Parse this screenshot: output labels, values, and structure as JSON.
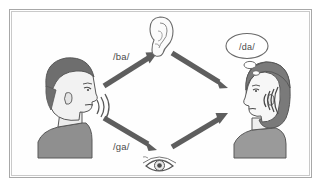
{
  "figure": {
    "name": "mcgurk-effect-diagram",
    "background_color": "#fefefe",
    "frame": {
      "outer_color": "#b5b5b5",
      "inner_color": "#d8d8d8"
    }
  },
  "speaker": {
    "name": "male-speaker",
    "facing": "right",
    "hair_color": "#6e6e6e",
    "skin_color": "#f2f2f2",
    "shirt_color": "#8f8f8f",
    "outline_color": "#555555",
    "sound_waves_count": 3
  },
  "listener": {
    "name": "female-listener",
    "facing": "left",
    "hair_color": "#7a7a7a",
    "skin_color": "#f7f7f7",
    "shirt_color": "#9a9a9a",
    "outline_color": "#555555",
    "sound_waves_count": 4
  },
  "icons": {
    "ear": {
      "label": "ear-icon",
      "outline_color": "#666666",
      "fill_color": "#fbfbfb"
    },
    "eye": {
      "label": "eye-icon",
      "outline_color": "#555555",
      "iris_color": "#8a8a8a"
    }
  },
  "arrows": {
    "color": "#5e5e5e",
    "items": [
      {
        "name": "arrow-audio-to-ear",
        "from": "speaker-mouth",
        "to": "ear-icon",
        "label": "/ba/"
      },
      {
        "name": "arrow-ear-to-listener",
        "from": "ear-icon",
        "to": "listener-head",
        "label": ""
      },
      {
        "name": "arrow-visual-to-eye",
        "from": "speaker-mouth",
        "to": "eye-icon",
        "label": "/ga/"
      },
      {
        "name": "arrow-eye-to-listener",
        "from": "eye-icon",
        "to": "listener-head",
        "label": ""
      }
    ]
  },
  "labels": {
    "auditory_stimulus": "/ba/",
    "visual_stimulus": "/ga/",
    "perceived_percept": "/da/"
  },
  "thought_bubble": {
    "name": "thought-bubble",
    "text": "/da/",
    "outline_color": "#6a6a6a",
    "fill_color": "#ffffff",
    "tail_bubbles": 2
  }
}
